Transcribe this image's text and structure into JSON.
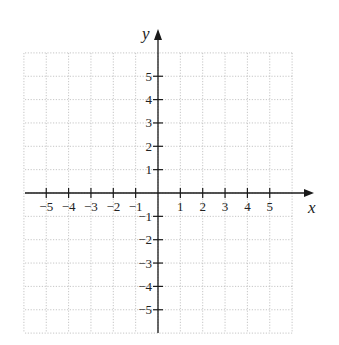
{
  "chart_data": {
    "type": "scatter",
    "title": "",
    "xlabel": "x",
    "ylabel": "y",
    "xlim": [
      -6,
      6
    ],
    "ylim": [
      -6,
      6
    ],
    "grid": true,
    "grid_style": "dotted",
    "x_ticks": [
      -5,
      -4,
      -3,
      -2,
      -1,
      1,
      2,
      3,
      4,
      5
    ],
    "y_ticks": [
      -5,
      -4,
      -3,
      -2,
      -1,
      1,
      2,
      3,
      4,
      5
    ],
    "x_tick_labels": [
      "−5",
      "−4",
      "−3",
      "−2",
      "−1",
      "1",
      "2",
      "3",
      "4",
      "5"
    ],
    "y_tick_labels": [
      "−5",
      "−4",
      "−3",
      "−2",
      "−1",
      "1",
      "2",
      "3",
      "4",
      "5"
    ],
    "series": [],
    "legend": null
  },
  "colors": {
    "axis": "#1a1a1a",
    "grid": "#b8b8b8",
    "background": "#ffffff"
  },
  "layout": {
    "origin_px": [
      158,
      193
    ],
    "unit_px_x": 22.35,
    "unit_px_y": 23.35,
    "grid_left": 25,
    "grid_right": 293,
    "grid_top": 53,
    "grid_bottom": 333,
    "x_arrow_tip": 314,
    "y_arrow_tip": 29
  }
}
